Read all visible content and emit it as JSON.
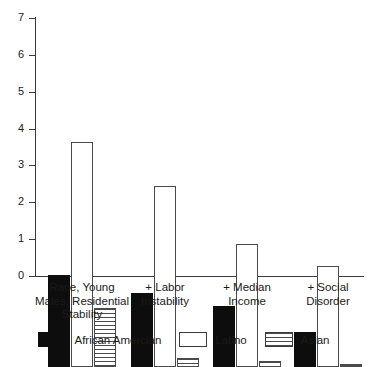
{
  "chart_data": {
    "type": "bar",
    "title": "",
    "subtitle": "",
    "xlabel": "",
    "ylabel": "",
    "ylim": [
      0,
      7
    ],
    "yticks": [
      0,
      1,
      2,
      3,
      4,
      5,
      6,
      7
    ],
    "ytick_labels": [
      "0",
      "1",
      "2",
      "3",
      "4",
      "5",
      "6",
      "7"
    ],
    "grid": false,
    "legend_position": "bottom",
    "categories": [
      "Race, Young\nMales, Residential\nStability",
      "+ Labor\nInstability",
      "+ Median\nIncome",
      "+ Social\nDisorder"
    ],
    "series": [
      {
        "name": "African Amercian",
        "fill": "solid-black",
        "color": "#0d0d0d",
        "values": [
          2.5,
          2.0,
          1.65,
          0.95
        ]
      },
      {
        "name": "Latino",
        "fill": "open-white",
        "color": "#ffffff",
        "values": [
          6.1,
          4.9,
          3.35,
          2.75
        ]
      },
      {
        "name": "Asian",
        "fill": "horizontal-hatch",
        "color": "#4a4a4a",
        "values": [
          1.6,
          0.25,
          0.15,
          0.07
        ]
      }
    ]
  },
  "legend": {
    "items": [
      {
        "label": "African Amercian",
        "swatch": "s-black"
      },
      {
        "label": "Latino",
        "swatch": "s-white"
      },
      {
        "label": "Asian",
        "swatch": "s-hatch"
      }
    ]
  }
}
